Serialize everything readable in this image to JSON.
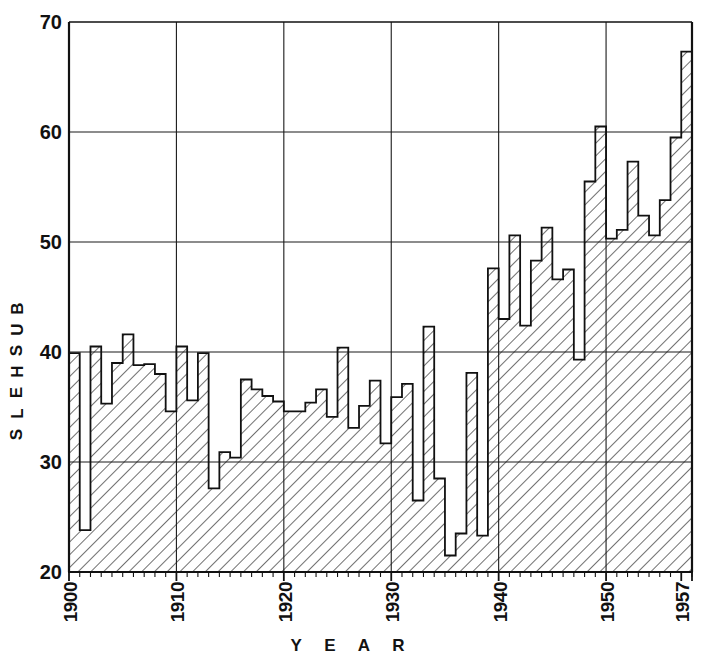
{
  "chart_data": {
    "type": "bar",
    "title": "",
    "subtitle": "",
    "xlabel": "Y E A R",
    "ylabel": "B U S H E L S",
    "xlim": [
      1900,
      1958
    ],
    "ylim": [
      20,
      70
    ],
    "ytick_values": [
      20,
      30,
      40,
      50,
      60,
      70
    ],
    "ytick_labels": [
      "20",
      "30",
      "40",
      "50",
      "60",
      "70"
    ],
    "xtick_values": [
      1900,
      1910,
      1920,
      1930,
      1940,
      1950,
      1957
    ],
    "xtick_labels": [
      "1900",
      "1910",
      "1920",
      "1930",
      "1940",
      "1950",
      "1957"
    ],
    "grid": true,
    "grid_axis": "both",
    "legend": null,
    "fill_style": "diagonal-hatch",
    "categories": [
      1900,
      1901,
      1902,
      1903,
      1904,
      1905,
      1906,
      1907,
      1908,
      1909,
      1910,
      1911,
      1912,
      1913,
      1914,
      1915,
      1916,
      1917,
      1918,
      1919,
      1920,
      1921,
      1922,
      1923,
      1924,
      1925,
      1926,
      1927,
      1928,
      1929,
      1930,
      1931,
      1932,
      1933,
      1934,
      1935,
      1936,
      1937,
      1938,
      1939,
      1940,
      1941,
      1942,
      1943,
      1944,
      1945,
      1946,
      1947,
      1948,
      1949,
      1950,
      1951,
      1952,
      1953,
      1954,
      1955,
      1956,
      1957
    ],
    "values": [
      39.9,
      23.8,
      40.5,
      35.3,
      39.0,
      41.6,
      38.8,
      38.9,
      38.0,
      34.6,
      40.5,
      35.6,
      39.9,
      27.6,
      30.9,
      30.4,
      37.5,
      36.6,
      36.0,
      35.5,
      34.6,
      34.6,
      35.4,
      36.6,
      34.1,
      40.4,
      33.1,
      35.1,
      37.4,
      31.7,
      35.9,
      37.1,
      26.5,
      42.3,
      28.5,
      21.5,
      23.5,
      38.1,
      23.3,
      47.6,
      43.0,
      50.6,
      42.4,
      48.3,
      51.3,
      46.6,
      47.5,
      39.3,
      55.5,
      60.5,
      50.3,
      51.1,
      57.3,
      52.4,
      50.6,
      53.8,
      59.5,
      67.3
    ],
    "accent_color": "#111111",
    "background_color": "#ffffff"
  },
  "axis": {
    "y_title_letters": [
      "B",
      "U",
      "S",
      "H",
      "E",
      "L",
      "S"
    ],
    "x_title": "Y E A R"
  }
}
